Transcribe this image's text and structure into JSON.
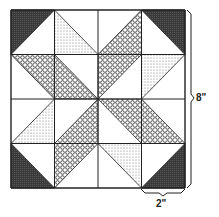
{
  "block": {
    "rows": 4,
    "cols": 4,
    "origin": [
      11,
      10
    ],
    "cell_w": 43.5,
    "cell_h": 44.5,
    "colors": {
      "dark": "#3a3a3a",
      "line": "#222222",
      "dot": "#777777",
      "hatch": "#333333"
    },
    "cells": [
      [
        {
          "fill": "dark",
          "corner": "tl"
        },
        {
          "fill": "dot",
          "corner": "bl"
        },
        {
          "fill": "hatch",
          "corner": "br"
        },
        {
          "fill": "dark",
          "corner": "tr"
        }
      ],
      [
        {
          "fill": "hatch",
          "corner": "tr"
        },
        {
          "fill": "hatch",
          "corner": "bl"
        },
        {
          "fill": "hatch",
          "corner": "tl"
        },
        {
          "fill": "dot",
          "corner": "tl"
        }
      ],
      [
        {
          "fill": "dot",
          "corner": "br"
        },
        {
          "fill": "hatch",
          "corner": "br"
        },
        {
          "fill": "hatch",
          "corner": "tr"
        },
        {
          "fill": "hatch",
          "corner": "bl"
        }
      ],
      [
        {
          "fill": "dark",
          "corner": "bl"
        },
        {
          "fill": "hatch",
          "corner": "tl"
        },
        {
          "fill": "dot",
          "corner": "tr"
        },
        {
          "fill": "dark",
          "corner": "br"
        }
      ]
    ]
  },
  "dimensions": {
    "block_size_label": "8\"",
    "cell_size_label": "2\""
  }
}
